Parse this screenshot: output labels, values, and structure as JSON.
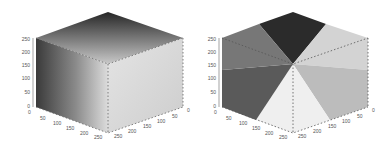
{
  "figures": [
    {
      "name": "rgb-cube-gradient",
      "z_ticks": [
        "0",
        "50",
        "100",
        "150",
        "200",
        "250"
      ],
      "x_ticks": [
        "0",
        "50",
        "100",
        "150",
        "200",
        "250"
      ],
      "y_ticks": [
        "0",
        "50",
        "100",
        "150",
        "200",
        "250"
      ],
      "colors": {
        "top_dark": "#2a2a2a",
        "top_light": "#c8c8c8",
        "left_dark": "#3c3c3c",
        "left_light": "#d8d8d8",
        "right_light": "#e6e6e6",
        "right_mid": "#cfcfcf"
      }
    },
    {
      "name": "hue-hexagon-cube",
      "z_ticks": [
        "0",
        "50",
        "100",
        "150",
        "200",
        "250"
      ],
      "x_ticks": [
        "0",
        "50",
        "100",
        "150",
        "200",
        "250"
      ],
      "y_ticks": [
        "0",
        "50",
        "100",
        "150",
        "200",
        "250"
      ],
      "sectors": [
        {
          "label": "top",
          "color": "#2b2b2b"
        },
        {
          "label": "top-right",
          "color": "#d2d2d2"
        },
        {
          "label": "right",
          "color": "#bdbdbd"
        },
        {
          "label": "bottom",
          "color": "#efefef"
        },
        {
          "label": "left-lower",
          "color": "#5a5a5a"
        },
        {
          "label": "left-upper",
          "color": "#767676"
        }
      ]
    }
  ]
}
